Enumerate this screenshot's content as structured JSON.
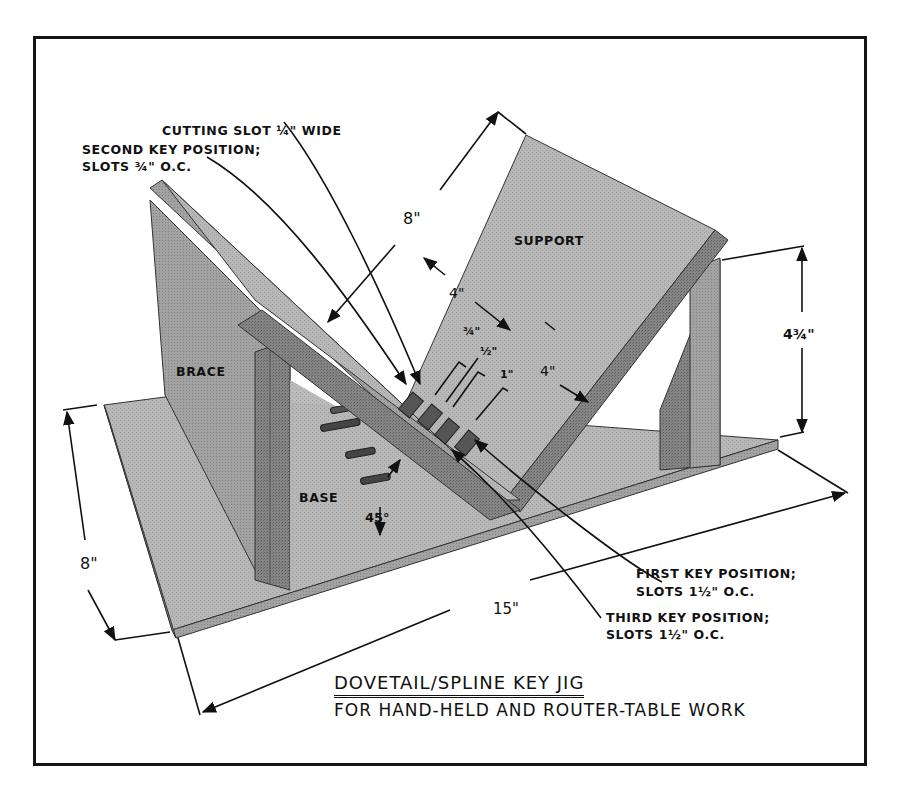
{
  "title": {
    "main": "DOVETAIL/SPLINE KEY JIG",
    "subtitle": "FOR HAND-HELD AND ROUTER-TABLE WORK"
  },
  "parts": {
    "support": "SUPPORT",
    "brace": "BRACE",
    "base": "BASE"
  },
  "callouts": {
    "cutting_slot": "CUTTING SLOT ¼\" WIDE",
    "second_key": {
      "line1": "SECOND KEY POSITION;",
      "line2": "SLOTS ¾\" O.C."
    },
    "first_key": {
      "line1": "FIRST KEY POSITION;",
      "line2": "SLOTS 1½\" O.C."
    },
    "third_key": {
      "line1": "THIRD KEY POSITION;",
      "line2": "SLOTS 1½\" O.C."
    }
  },
  "dimensions": {
    "support_length": "8\"",
    "support_to_slot": "4\"",
    "slot_to_edge": "4\"",
    "key_3_4": "¾\"",
    "key_1_2": "½\"",
    "key_1": "1\"",
    "height": "4¾\"",
    "base_depth": "8\"",
    "base_length": "15\"",
    "angle": "45°"
  },
  "colors": {
    "ink": "#111111",
    "wood_light": "#b9b9b9",
    "wood_mid": "#9a9a9a",
    "wood_dark": "#6e6e6e",
    "wood_edge": "#7d7d7d",
    "frame": "#151515"
  }
}
